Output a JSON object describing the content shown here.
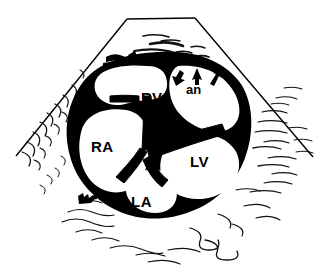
{
  "figure": {
    "kind": "echocardiogram-line-drawing",
    "view_name": "apical four-chamber view",
    "modality": "two-dimensional echocardiography",
    "ink_color": "#000000",
    "background_color": "#ffffff"
  },
  "labels": {
    "right_ventricle": "RV",
    "right_atrium": "RA",
    "left_ventricle": "LV",
    "left_atrium": "LA",
    "aneurysm": "an"
  },
  "annotations": {
    "arrow_count": 3,
    "arrow_target": "an",
    "arrow_directions": [
      "up-left",
      "up",
      "up-right"
    ]
  },
  "structures": [
    {
      "name": "RV",
      "label": "RV",
      "position": "upper-left-center"
    },
    {
      "name": "RA",
      "label": "RA",
      "position": "left"
    },
    {
      "name": "LV",
      "label": "LV",
      "position": "right"
    },
    {
      "name": "LA",
      "label": "LA",
      "position": "bottom-center"
    },
    {
      "name": "an",
      "label": "an",
      "position": "upper-right"
    }
  ],
  "sector": {
    "shape": "ultrasound sector cone",
    "apex_edge": "flat top",
    "texture": "hand-drawn speckle hatching"
  }
}
